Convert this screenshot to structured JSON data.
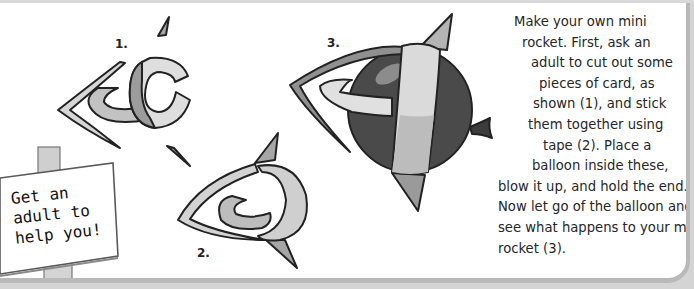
{
  "instructions": {
    "lines": [
      "Make your own mini",
      "rocket. First, ask an",
      "adult to cut out some",
      "pieces of card, as",
      "shown (1), and stick",
      "them together using",
      "tape (2). Place a",
      "balloon inside these,",
      "blow it up, and hold the end.",
      "Now let go of the balloon and",
      "see what happens to your mini",
      "rocket (3)."
    ]
  },
  "sign": {
    "lines": [
      "Get an",
      "adult to",
      "help you!"
    ]
  },
  "steps": [
    {
      "label": "1."
    },
    {
      "label": "2."
    },
    {
      "label": "3."
    }
  ],
  "colors": {
    "frame": "#b9b9b9",
    "background": "#ffffff",
    "ink": "#222222",
    "card_light": "#dcdcdc",
    "card_mid": "#a8a8a8",
    "balloon": "#4a4a4a"
  }
}
